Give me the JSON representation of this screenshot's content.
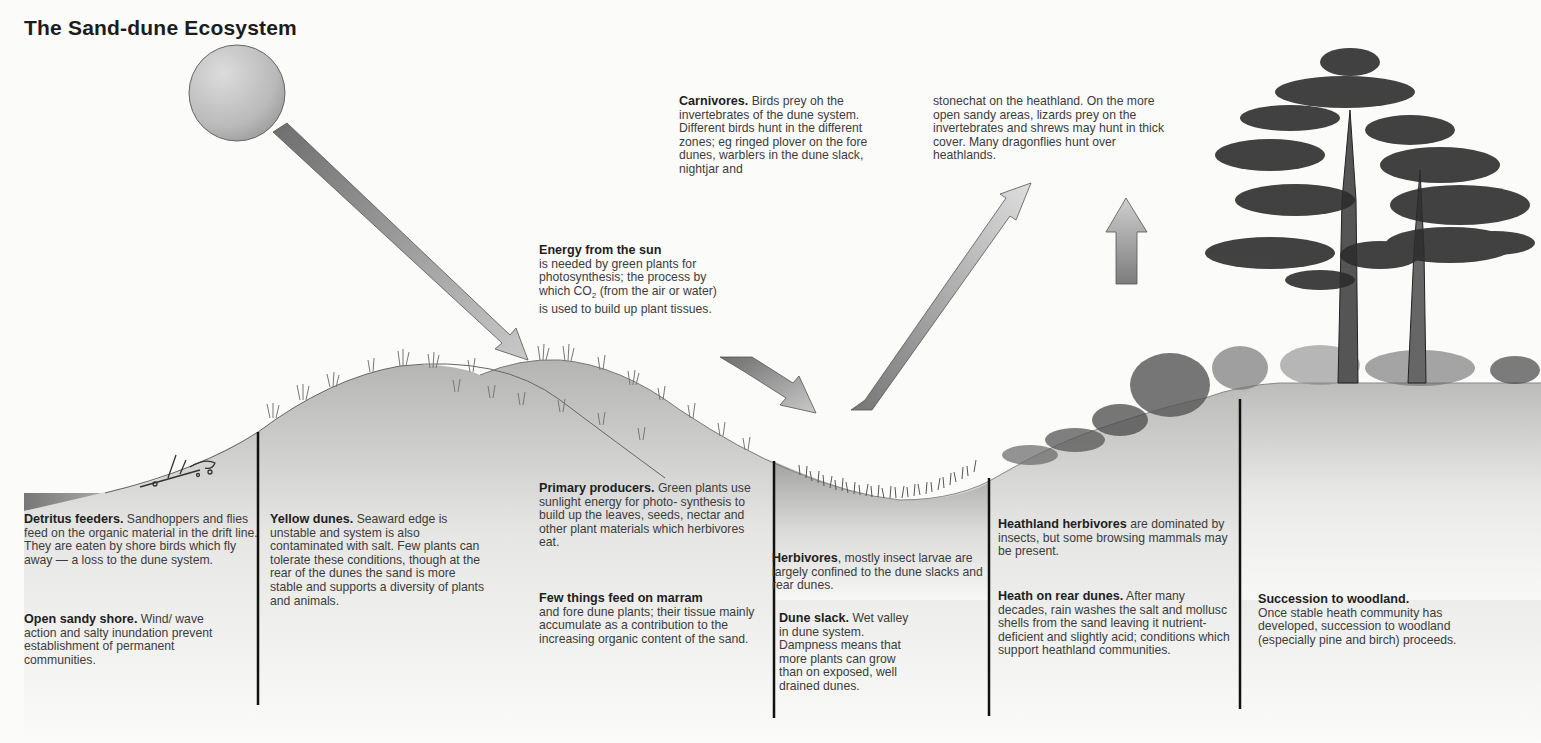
{
  "title": "The Sand-dune Ecosystem",
  "labels": {
    "carnivores": {
      "heading": "Carnivores.",
      "text": "Birds prey oh the invertebrates of the dune system. Different birds hunt in the different zones; eg ringed plover on the fore dunes, warblers in the dune slack, nightjar and",
      "continued": "stonechat on the heathland. On the more open sandy areas, lizards prey on the invertebrates and shrews may hunt in thick cover. Many dragonflies hunt over heathlands."
    },
    "energy": {
      "heading": "Energy from the sun",
      "text_before": "is needed by green plants for photosynthesis; the process by which CO",
      "subscript": "2",
      "text_after": " (from the air or water) is used to build up plant tissues."
    },
    "detritus": {
      "heading": "Detritus feeders.",
      "text": "Sandhoppers and flies feed on the organic material in the drift line. They are eaten by shore birds which fly away — a loss to the dune system."
    },
    "open_shore": {
      "heading": "Open sandy shore.",
      "text": "Wind/ wave action and salty inundation prevent establishment of permanent communities."
    },
    "yellow_dunes": {
      "heading": "Yellow dunes.",
      "text": "Seaward edge is unstable and system is also contaminated with salt. Few plants can tolerate these conditions, though at the rear of the dunes the sand is more stable and supports a diversity of plants and animals."
    },
    "primary_producers": {
      "heading": "Primary producers.",
      "text": "Green plants use sunlight energy for photo- synthesis to build up the leaves, seeds, nectar and other plant materials which herbivores eat."
    },
    "marram": {
      "heading": "Few things feed on marram",
      "text": "and fore dune plants; their tissue mainly accumulate as a contribution to the increasing organic content of the sand."
    },
    "herbivores": {
      "heading": "Herbivores",
      "text": ", mostly insect larvae are largely confined to the dune slacks and rear dunes."
    },
    "dune_slack": {
      "heading": "Dune slack.",
      "text": "Wet valley in dune system. Dampness means that more plants can grow than on exposed, well drained dunes."
    },
    "heathland_herbivores": {
      "heading": "Heathland herbivores",
      "text": "are dominated by insects, but some browsing mammals may be present."
    },
    "heath_rear": {
      "heading": "Heath on rear dunes.",
      "text": "After many decades, rain washes the salt and mollusc shells from the sand leaving it nutrient-deficient and slightly acid; conditions which support heathland communities."
    },
    "woodland": {
      "heading": "Succession to woodland.",
      "text": "Once stable heath community has developed, succession to woodland (especially pine and birch) proceeds."
    }
  },
  "icons": [
    "sun-icon",
    "energy-arrow-icon",
    "pine-tree-icon",
    "marram-grass-icon",
    "driftwood-icon"
  ],
  "colors": {
    "background": "#fbfbfa",
    "sand_light": "#f0f0ee",
    "sand_dark": "#a9a9a9",
    "sea": "#8a8a8a",
    "arrow_dark": "#7b7b7b",
    "arrow_light": "#d2d2d2",
    "divider": "#111111"
  }
}
